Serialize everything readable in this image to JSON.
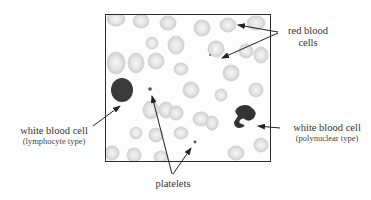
{
  "figure": {
    "labels": {
      "red_blood_cells": "red blood cells",
      "red_blood_cells_line1": "red blood",
      "red_blood_cells_line2": "cells",
      "wbc_lymphocyte": "white blood cell",
      "wbc_lymphocyte_type": "(lymphocyte type)",
      "wbc_polynuclear": "white blood cell",
      "wbc_polynuclear_type": "(polynuclear type)",
      "platelets": "platelets"
    },
    "colors": {
      "frame": "#2b2b2b",
      "rbc": "#c9c9c9",
      "wbc": "#3a3a3a",
      "arrow": "#222222",
      "text": "#333333"
    }
  }
}
